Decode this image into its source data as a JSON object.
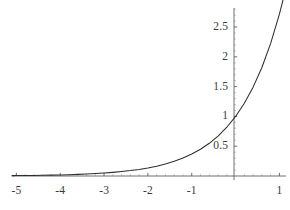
{
  "chart_data": {
    "type": "line",
    "title": "",
    "subtitle": "",
    "xlabel": "",
    "ylabel": "",
    "function": "y = e^x",
    "grid": false,
    "legend": null,
    "xlim": [
      -5.1,
      1.15
    ],
    "ylim": [
      -0.12,
      2.82
    ],
    "x_ticks": [
      -5,
      -4,
      -3,
      -2,
      -1,
      1
    ],
    "x_tick_labels": [
      "-5",
      "-4",
      "-3",
      "-2",
      "-1",
      "1"
    ],
    "y_ticks": [
      0.5,
      1,
      1.5,
      2,
      2.5
    ],
    "y_tick_labels": [
      "0.5",
      "1",
      "1.5",
      "2",
      "2.5"
    ],
    "x_minor_tick_step": 0.2,
    "y_minor_tick_step": 0.1,
    "axis_color": "#4d4d4d",
    "curve_color": "#2e2e2e",
    "background_color": "#ffffff",
    "series": [
      {
        "name": "exp(x)",
        "x": [
          -5.1,
          -5.0,
          -4.8,
          -4.6,
          -4.4,
          -4.2,
          -4.0,
          -3.8,
          -3.6,
          -3.4,
          -3.2,
          -3.0,
          -2.8,
          -2.6,
          -2.4,
          -2.2,
          -2.0,
          -1.8,
          -1.6,
          -1.4,
          -1.2,
          -1.0,
          -0.8,
          -0.6,
          -0.4,
          -0.2,
          0.0,
          0.2,
          0.4,
          0.6,
          0.8,
          1.0,
          1.13
        ],
        "y": [
          0.0061,
          0.0067,
          0.0082,
          0.0101,
          0.0123,
          0.015,
          0.0183,
          0.0224,
          0.0273,
          0.0334,
          0.0408,
          0.0498,
          0.0608,
          0.0743,
          0.0907,
          0.1108,
          0.1353,
          0.1653,
          0.2019,
          0.2466,
          0.3012,
          0.3679,
          0.4493,
          0.5488,
          0.6703,
          0.8187,
          1.0,
          1.2214,
          1.4918,
          1.8221,
          2.2255,
          2.7183,
          3.0957
        ]
      }
    ],
    "notable_points": [
      {
        "x": 0,
        "y": 1,
        "note": "y-intercept at 1"
      },
      {
        "x": 1,
        "y": 2.718,
        "note": "e"
      }
    ]
  }
}
